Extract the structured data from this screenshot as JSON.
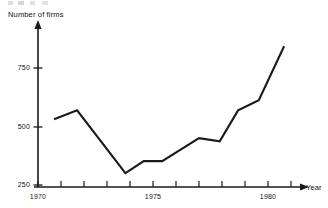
{
  "chart_data": {
    "type": "line",
    "title": "",
    "subtitle": "",
    "xlabel": "Year",
    "ylabel": "Number of firms",
    "xlim": [
      1970,
      1981.5
    ],
    "ylim": [
      250,
      870
    ],
    "grid": false,
    "legend": null,
    "x_ticks_major": [
      1970,
      1975,
      1980
    ],
    "x_tick_labels": [
      "1970",
      "1975",
      "1980"
    ],
    "x_ticks_minor": [
      1971,
      1972,
      1973,
      1974,
      1976,
      1977,
      1978,
      1979,
      1981
    ],
    "y_ticks": [
      250,
      500,
      750
    ],
    "y_tick_labels": [
      "250",
      "500",
      "750"
    ],
    "series": [
      {
        "name": "Number of firms",
        "color": "#1a1a1a",
        "x": [
          1970.7,
          1971.7,
          1973.8,
          1974.6,
          1975.4,
          1977.0,
          1977.9,
          1978.7,
          1979.6,
          1980.7
        ],
        "values": [
          531,
          569,
          301,
          352,
          352,
          450,
          437,
          569,
          612,
          843
        ]
      }
    ]
  },
  "axes": {
    "y_title": "Number of firms",
    "x_title": "Year"
  },
  "colors": {
    "line": "#1a1a1a",
    "axis": "#1a1a1a",
    "background": "#ffffff",
    "text": "#111111"
  }
}
